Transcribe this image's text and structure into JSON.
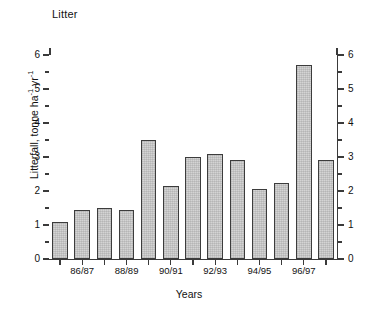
{
  "chart_data": {
    "type": "bar",
    "title": "Litter",
    "xlabel": "Years",
    "ylabel": "Litterfall, tonne ha⁻¹ yr⁻¹",
    "ylabel_parts": {
      "base": "Litterfall, tonne ha",
      "sup1": "-1",
      "mid": " yr",
      "sup2": "-1"
    },
    "categories": [
      "85/86",
      "86/87",
      "87/88",
      "88/89",
      "89/90",
      "90/91",
      "91/92",
      "92/93",
      "93/94",
      "94/95",
      "95/96",
      "96/97",
      "97/98"
    ],
    "values": [
      1.1,
      1.45,
      1.5,
      1.45,
      3.5,
      2.15,
      3.0,
      3.1,
      2.9,
      2.05,
      2.25,
      5.7,
      2.9
    ],
    "ylim": [
      0,
      6
    ],
    "ytick_labels": [
      "0",
      "1",
      "2",
      "3",
      "4",
      "5",
      "6"
    ],
    "ytick_values": [
      0,
      1,
      2,
      3,
      4,
      5,
      6
    ],
    "yminor_values": [
      0.5,
      1.5,
      2.5,
      3.5,
      4.5,
      5.5,
      6.5
    ],
    "xtick_labels": [
      "86/87",
      "88/89",
      "90/91",
      "92/93",
      "94/95",
      "96/97"
    ],
    "xtick_label_indices": [
      1,
      3,
      5,
      7,
      9,
      11
    ],
    "grid": false,
    "legend": null,
    "dual_y_axis": true,
    "bar_fill": "#d4d4d4",
    "bar_edge": "#3c3c3c",
    "axis_color": "#3a3a3a",
    "n_bars": 13
  }
}
